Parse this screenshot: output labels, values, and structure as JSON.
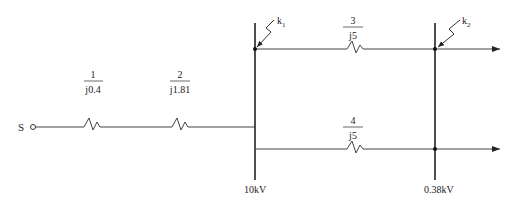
{
  "diagram": {
    "source": {
      "label": "S"
    },
    "elements": [
      {
        "num": "1",
        "impedance": "j0.4"
      },
      {
        "num": "2",
        "impedance": "j1.81"
      },
      {
        "num": "3",
        "impedance": "j5"
      },
      {
        "num": "4",
        "impedance": "j5"
      }
    ],
    "faults": [
      {
        "label": "k",
        "sub": "1"
      },
      {
        "label": "k",
        "sub": "2"
      }
    ],
    "buses": [
      {
        "label": "10kV"
      },
      {
        "label": "0.38kV"
      }
    ]
  }
}
